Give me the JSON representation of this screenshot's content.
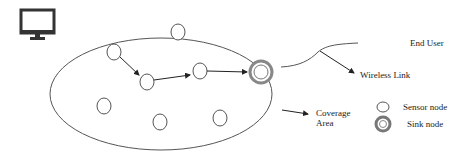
{
  "diagram": {
    "labels": {
      "end_user": "End User",
      "wireless_link": "Wireless Link",
      "coverage_area_line1": "Coverage",
      "coverage_area_line2": "Area"
    },
    "legend": {
      "sensor_node": "Sensor node",
      "sink_node": "Sink node"
    },
    "icons": {
      "end_user_device": "monitor-icon"
    },
    "colors": {
      "stroke": "#555555",
      "sink_ring": "#888888",
      "arrow": "#222222",
      "text": "#222222"
    }
  }
}
